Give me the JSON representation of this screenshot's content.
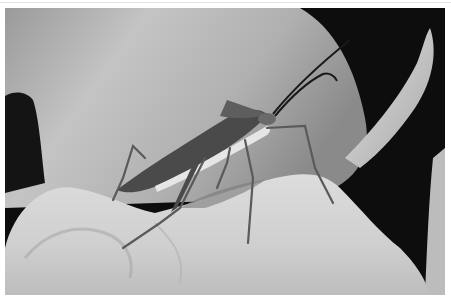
{
  "image": {
    "subject": "leaf-footed bug on a leaf",
    "alt": "Grayscale macro photograph of a long-legged bug with long antennae standing on a fuzzy leaf, with a large blurred leaf in the background",
    "tone": "grayscale",
    "colors": {
      "background_dark": "#0d0d0d",
      "blurred_leaf": "#b4b4b4",
      "foreground_leaf": "#d2d2d2",
      "insect_body": "#555555",
      "insect_stripe": "#e6e6e6",
      "border": "#ffffff"
    }
  }
}
